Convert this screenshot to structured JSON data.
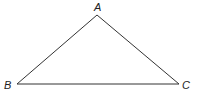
{
  "diagram": {
    "type": "triangle",
    "vertices": [
      {
        "label": "A",
        "x": 97,
        "y": 15,
        "label_x": 94,
        "label_y": 11
      },
      {
        "label": "B",
        "x": 17,
        "y": 84,
        "label_x": 4,
        "label_y": 89
      },
      {
        "label": "C",
        "x": 179,
        "y": 84,
        "label_x": 182,
        "label_y": 89
      }
    ],
    "stroke_color": "#333333"
  }
}
